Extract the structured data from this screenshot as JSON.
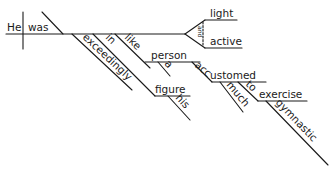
{
  "diagram": {
    "type": "reed-kellogg-sentence-diagram",
    "sentence_words": {
      "subject": "He",
      "verb": "was",
      "predicate_adjectives": [
        "light",
        "active"
      ],
      "conjunction": "and",
      "adverb": "exceedingly",
      "prep1": "in",
      "prep1_object": "figure",
      "prep1_object_modifier": "his",
      "prep2": "like",
      "prep2_object": "person",
      "prep2_article": "a",
      "participle": "accustomed",
      "participle_modifier": "much",
      "prep3": "to",
      "prep3_object": "exercise",
      "prep3_object_modifier": "gymnastic"
    }
  }
}
